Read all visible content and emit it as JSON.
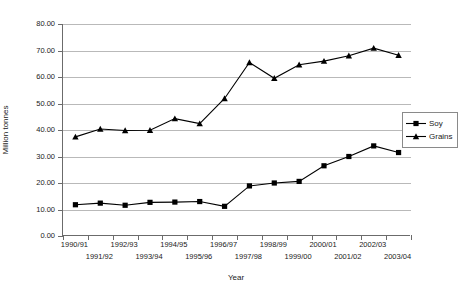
{
  "chart_data": {
    "type": "line",
    "title": "",
    "xlabel": "Year",
    "ylabel": "Million tonnes",
    "ylim": [
      0,
      80
    ],
    "ytick_step": 10,
    "ytick_labels": [
      "0.00",
      "10.00",
      "20.00",
      "30.00",
      "40.00",
      "50.00",
      "60.00",
      "70.00",
      "80.00"
    ],
    "ytick_values": [
      0,
      10,
      20,
      30,
      40,
      50,
      60,
      70,
      80
    ],
    "grid": "horizontal",
    "legend_position": "right",
    "categories": [
      "1990/91",
      "1991/92",
      "1992/93",
      "1993/94",
      "1994/95",
      "1995/96",
      "1996/97",
      "1997/98",
      "1998/99",
      "1999/00",
      "2000/01",
      "2001/02",
      "2002/03",
      "2003/04"
    ],
    "series": [
      {
        "name": "Soy",
        "marker": "square",
        "color": "#000000",
        "values": [
          11.8,
          12.4,
          11.6,
          12.7,
          12.8,
          13.0,
          11.2,
          18.9,
          20.0,
          20.6,
          26.5,
          30.0,
          34.0,
          31.5
        ]
      },
      {
        "name": "Grains",
        "marker": "triangle",
        "color": "#000000",
        "values": [
          37.4,
          40.4,
          39.8,
          39.9,
          44.3,
          42.4,
          51.9,
          65.5,
          59.5,
          64.6,
          66.0,
          68.0,
          70.9,
          68.2
        ]
      }
    ]
  },
  "legend": {
    "items": [
      {
        "label": "Soy",
        "marker": "square"
      },
      {
        "label": "Grains",
        "marker": "triangle"
      }
    ]
  }
}
